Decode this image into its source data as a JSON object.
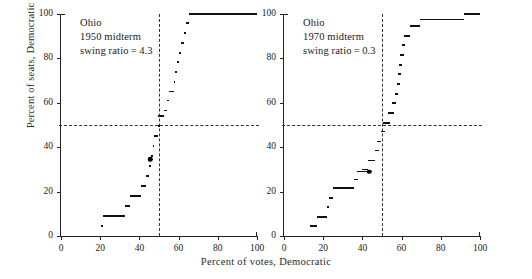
{
  "figure": {
    "xlabel": "Percent of votes, Democratic",
    "ylabel": "Percent of seats, Democratic",
    "x_ticks": [
      0,
      20,
      40,
      60,
      80,
      100
    ],
    "y_ticks": [
      0,
      20,
      40,
      60,
      80,
      100
    ],
    "xlim": [
      0,
      100
    ],
    "ylim": [
      0,
      100
    ],
    "reference_lines": {
      "horizontal_value": 50,
      "vertical_value": 50,
      "style": "dashed"
    },
    "ink_color": "#111111",
    "background_color": "#ffffff"
  },
  "chart_data": [
    {
      "type": "line",
      "title": "Ohio 1950 midterm",
      "panel": "left",
      "annotation": {
        "line1": "Ohio",
        "line2": "1950 midterm",
        "line3": "swing ratio = 4.3"
      },
      "state": "Ohio",
      "year": "1950",
      "election_type": "midterm",
      "swing_ratio": "4.3",
      "xlabel": "Percent of votes, Democratic",
      "ylabel": "Percent of seats, Democratic",
      "xlim": [
        0,
        100
      ],
      "ylim": [
        0,
        100
      ],
      "grid": false,
      "legend": "none",
      "actual_election_point": {
        "x": 45.5,
        "y": 34.5
      },
      "steps": [
        {
          "x0": 20.3,
          "x1": 21.6,
          "y": 4.5
        },
        {
          "x0": 21.6,
          "x1": 32.8,
          "y": 9.0
        },
        {
          "x0": 32.8,
          "x1": 35.0,
          "y": 13.5
        },
        {
          "x0": 35.0,
          "x1": 41.0,
          "y": 18.0
        },
        {
          "x0": 41.0,
          "x1": 43.6,
          "y": 22.5
        },
        {
          "x0": 43.6,
          "x1": 45.0,
          "y": 27.0
        },
        {
          "x0": 45.0,
          "x1": 45.9,
          "y": 31.5
        },
        {
          "x0": 44.6,
          "x1": 47.0,
          "y": 34.5
        },
        {
          "x0": 45.9,
          "x1": 46.8,
          "y": 36.0
        },
        {
          "x0": 46.8,
          "x1": 47.6,
          "y": 40.5
        },
        {
          "x0": 47.6,
          "x1": 49.4,
          "y": 45.0
        },
        {
          "x0": 49.4,
          "x1": 50.6,
          "y": 49.5
        },
        {
          "x0": 49.6,
          "x1": 52.6,
          "y": 54.0
        },
        {
          "x0": 52.6,
          "x1": 54.0,
          "y": 56.5
        },
        {
          "x0": 54.0,
          "x1": 55.2,
          "y": 61.0
        },
        {
          "x0": 55.2,
          "x1": 57.6,
          "y": 65.0
        },
        {
          "x0": 57.6,
          "x1": 58.4,
          "y": 69.5
        },
        {
          "x0": 58.4,
          "x1": 59.4,
          "y": 74.0
        },
        {
          "x0": 59.4,
          "x1": 60.4,
          "y": 78.5
        },
        {
          "x0": 60.4,
          "x1": 61.4,
          "y": 82.5
        },
        {
          "x0": 61.4,
          "x1": 62.6,
          "y": 87.0
        },
        {
          "x0": 62.6,
          "x1": 64.0,
          "y": 91.5
        },
        {
          "x0": 64.0,
          "x1": 65.2,
          "y": 96.0
        },
        {
          "x0": 65.2,
          "x1": 100.0,
          "y": 100.0
        }
      ]
    },
    {
      "type": "line",
      "title": "Ohio 1970 midterm",
      "panel": "right",
      "annotation": {
        "line1": "Ohio",
        "line2": "1970 midterm",
        "line3": "swing ratio = 0.3"
      },
      "state": "Ohio",
      "year": "1970",
      "election_type": "midterm",
      "swing_ratio": "0.3",
      "xlabel": "Percent of votes, Democratic",
      "ylabel": "Percent of seats, Democratic",
      "xlim": [
        0,
        100
      ],
      "ylim": [
        0,
        100
      ],
      "grid": false,
      "legend": "none",
      "actual_election_point": {
        "x": 43.6,
        "y": 29.0
      },
      "steps": [
        {
          "x0": 13.4,
          "x1": 16.6,
          "y": 4.5
        },
        {
          "x0": 16.6,
          "x1": 21.8,
          "y": 8.5
        },
        {
          "x0": 21.8,
          "x1": 23.0,
          "y": 13.0
        },
        {
          "x0": 23.0,
          "x1": 25.2,
          "y": 17.0
        },
        {
          "x0": 25.2,
          "x1": 35.6,
          "y": 21.5
        },
        {
          "x0": 35.6,
          "x1": 37.8,
          "y": 25.5
        },
        {
          "x0": 37.4,
          "x1": 44.8,
          "y": 29.0
        },
        {
          "x0": 40.0,
          "x1": 43.0,
          "y": 30.0
        },
        {
          "x0": 43.0,
          "x1": 46.4,
          "y": 34.0
        },
        {
          "x0": 46.4,
          "x1": 48.6,
          "y": 38.5
        },
        {
          "x0": 47.6,
          "x1": 49.4,
          "y": 42.5
        },
        {
          "x0": 49.4,
          "x1": 51.6,
          "y": 47.0
        },
        {
          "x0": 50.6,
          "x1": 54.2,
          "y": 51.0
        },
        {
          "x0": 53.0,
          "x1": 56.0,
          "y": 55.5
        },
        {
          "x0": 55.2,
          "x1": 57.0,
          "y": 60.0
        },
        {
          "x0": 56.4,
          "x1": 58.2,
          "y": 64.0
        },
        {
          "x0": 57.4,
          "x1": 59.0,
          "y": 68.5
        },
        {
          "x0": 58.2,
          "x1": 59.8,
          "y": 73.0
        },
        {
          "x0": 58.8,
          "x1": 60.4,
          "y": 77.0
        },
        {
          "x0": 59.4,
          "x1": 61.0,
          "y": 81.5
        },
        {
          "x0": 60.0,
          "x1": 61.6,
          "y": 86.0
        },
        {
          "x0": 61.0,
          "x1": 64.2,
          "y": 90.0
        },
        {
          "x0": 64.2,
          "x1": 69.6,
          "y": 94.5
        },
        {
          "x0": 69.6,
          "x1": 91.6,
          "y": 97.5
        },
        {
          "x0": 91.6,
          "x1": 100.0,
          "y": 100.0
        }
      ]
    }
  ]
}
